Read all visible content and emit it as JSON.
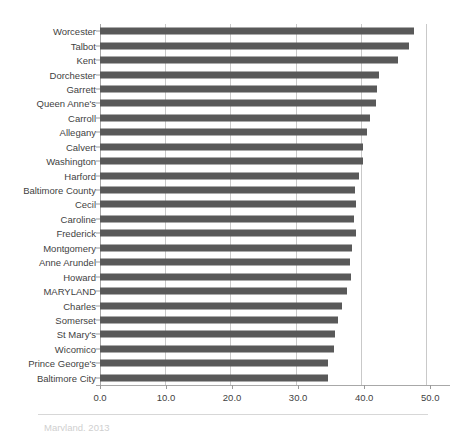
{
  "chart_data": {
    "type": "bar",
    "orientation": "horizontal",
    "title": "",
    "xlabel": "",
    "ylabel": "",
    "xlim": [
      0.0,
      53.0
    ],
    "xticks": [
      "0.0",
      "10.0",
      "20.0",
      "30.0",
      "40.0",
      "50.0"
    ],
    "xtick_values": [
      0,
      10,
      20,
      30,
      40,
      50
    ],
    "grid": true,
    "grid_axis": "x",
    "legend": "none",
    "bar_color": "#595959",
    "categories": [
      "Worcester",
      "Talbot",
      "Kent",
      "Dorchester",
      "Garrett",
      "Queen Anne's",
      "Carroll",
      "Allegany",
      "Calvert",
      "Washington",
      "Harford",
      "Baltimore County",
      "Cecil",
      "Caroline",
      "Frederick",
      "Montgomery",
      "Anne Arundel",
      "Howard",
      "MARYLAND",
      "Charles",
      "Somerset",
      "St Mary's",
      "Wicomico",
      "Prince George's",
      "Baltimore City"
    ],
    "values": [
      47.6,
      46.8,
      45.2,
      42.3,
      42.0,
      41.8,
      40.9,
      40.5,
      39.8,
      39.8,
      39.2,
      38.6,
      38.8,
      38.5,
      38.8,
      38.2,
      37.8,
      38.0,
      37.4,
      36.6,
      36.0,
      35.6,
      35.4,
      34.6,
      34.6
    ]
  },
  "footer": {
    "caption_fragment": "Maryland, 2013"
  }
}
